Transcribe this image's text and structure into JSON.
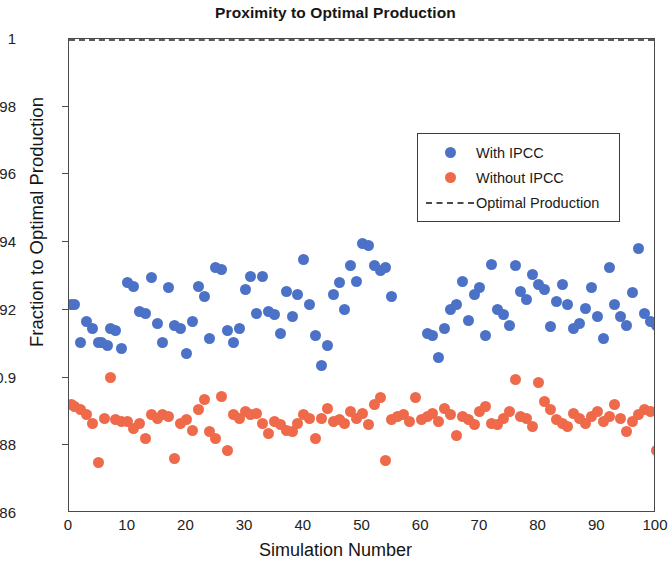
{
  "chart_data": {
    "type": "scatter",
    "title": "Proximity to Optimal Production",
    "xlabel": "Simulation Number",
    "ylabel": "Fraction to Optimal Production",
    "xlim": [
      0,
      100
    ],
    "ylim": [
      0.86,
      1
    ],
    "xticks": [
      0,
      10,
      20,
      30,
      40,
      50,
      60,
      70,
      80,
      90,
      100
    ],
    "xtick_labels": [
      "0",
      "10",
      "20",
      "30",
      "40",
      "50",
      "60",
      "70",
      "80",
      "90",
      "100"
    ],
    "yticks": [
      0.86,
      0.88,
      0.9,
      0.92,
      0.94,
      0.96,
      0.98,
      1
    ],
    "ytick_labels": [
      "0.86",
      "0.88",
      "0.9",
      "0.92",
      "0.94",
      "0.96",
      "0.98",
      "1"
    ],
    "grid": false,
    "legend_position": "upper-right-inside",
    "colors": {
      "with_ipcc": "#4c72c8",
      "without_ipcc": "#ee6a4b",
      "optimal": "#5a5a5a"
    },
    "reference_line": {
      "label": "Optimal Production",
      "y": 1.0,
      "style": "dashed"
    },
    "legend": [
      {
        "label": "With IPCC",
        "marker": "circle",
        "color": "#4c72c8"
      },
      {
        "label": "Without IPCC",
        "marker": "circle",
        "color": "#ee6a4b"
      },
      {
        "label": "Optimal Production",
        "marker": "dashed-line",
        "color": "#5a5a5a"
      }
    ],
    "series": [
      {
        "name": "With IPCC",
        "color": "#4c72c8",
        "x": [
          0.5,
          1,
          2,
          3,
          4,
          5,
          5.5,
          6.5,
          7,
          8,
          9,
          10,
          11,
          12,
          13,
          14,
          15,
          16,
          17,
          18,
          19,
          20,
          21,
          22,
          23,
          24,
          25,
          26,
          27,
          28,
          29,
          30,
          31,
          32,
          33,
          34,
          35,
          36,
          37,
          38,
          39,
          40,
          41,
          42,
          43,
          44,
          45,
          46,
          47,
          48,
          49,
          50,
          51,
          52,
          53,
          54,
          55,
          61,
          62,
          63,
          64,
          65,
          66,
          67,
          68,
          69,
          70,
          71,
          72,
          73,
          74,
          75,
          76,
          77,
          78,
          79,
          80,
          81,
          82,
          83,
          84,
          85,
          86,
          87,
          88,
          89,
          90,
          91,
          92,
          93,
          94,
          95,
          96,
          97,
          98,
          99,
          100
        ],
        "y": [
          0.9215,
          0.9215,
          0.9105,
          0.9165,
          0.9145,
          0.9105,
          0.9105,
          0.9095,
          0.9145,
          0.914,
          0.9085,
          0.928,
          0.927,
          0.9195,
          0.919,
          0.9295,
          0.916,
          0.9105,
          0.9265,
          0.9155,
          0.9145,
          0.907,
          0.9165,
          0.927,
          0.924,
          0.9115,
          0.9325,
          0.932,
          0.914,
          0.9105,
          0.9145,
          0.926,
          0.93,
          0.919,
          0.93,
          0.9195,
          0.9185,
          0.913,
          0.9255,
          0.918,
          0.9245,
          0.935,
          0.9215,
          0.9125,
          0.9035,
          0.9095,
          0.9245,
          0.928,
          0.92,
          0.933,
          0.9285,
          0.9395,
          0.939,
          0.933,
          0.9315,
          0.9325,
          0.924,
          0.913,
          0.9125,
          0.906,
          0.9145,
          0.92,
          0.9215,
          0.9285,
          0.917,
          0.9245,
          0.9265,
          0.9125,
          0.9335,
          0.92,
          0.9185,
          0.9155,
          0.933,
          0.9255,
          0.923,
          0.9305,
          0.9275,
          0.926,
          0.915,
          0.9225,
          0.9275,
          0.9215,
          0.9145,
          0.916,
          0.9205,
          0.9265,
          0.918,
          0.9115,
          0.9325,
          0.9215,
          0.918,
          0.9155,
          0.925,
          0.938,
          0.919,
          0.9165,
          0.9155
        ]
      },
      {
        "name": "Without IPCC",
        "color": "#ee6a4b",
        "x": [
          0.5,
          1,
          2,
          3,
          4,
          5,
          6,
          7,
          8,
          9,
          10,
          11,
          12,
          13,
          14,
          15,
          16,
          17,
          18,
          19,
          20,
          21,
          22,
          23,
          24,
          25,
          26,
          27,
          28,
          29,
          30,
          31,
          32,
          33,
          34,
          35,
          36,
          37,
          38,
          39,
          40,
          41,
          42,
          43,
          44,
          45,
          46,
          47,
          48,
          49,
          50,
          51,
          52,
          53,
          54,
          55,
          56,
          57,
          58,
          59,
          60,
          61,
          62,
          63,
          64,
          65,
          66,
          67,
          68,
          69,
          70,
          71,
          72,
          73,
          74,
          75,
          76,
          77,
          78,
          79,
          80,
          81,
          82,
          83,
          84,
          85,
          86,
          87,
          88,
          89,
          90,
          91,
          92,
          93,
          94,
          95,
          96,
          97,
          98,
          99,
          100
        ],
        "y": [
          0.892,
          0.8915,
          0.8905,
          0.889,
          0.8865,
          0.875,
          0.888,
          0.9,
          0.8875,
          0.887,
          0.887,
          0.885,
          0.8865,
          0.882,
          0.889,
          0.888,
          0.889,
          0.8885,
          0.876,
          0.8865,
          0.8875,
          0.8845,
          0.8905,
          0.8935,
          0.884,
          0.882,
          0.8945,
          0.8785,
          0.889,
          0.888,
          0.89,
          0.889,
          0.8895,
          0.8865,
          0.8835,
          0.887,
          0.886,
          0.8845,
          0.884,
          0.8865,
          0.889,
          0.888,
          0.882,
          0.888,
          0.891,
          0.887,
          0.8875,
          0.8865,
          0.89,
          0.888,
          0.8895,
          0.886,
          0.892,
          0.894,
          0.8755,
          0.8875,
          0.8885,
          0.889,
          0.887,
          0.894,
          0.8875,
          0.8885,
          0.8895,
          0.887,
          0.891,
          0.889,
          0.883,
          0.8885,
          0.8875,
          0.886,
          0.89,
          0.8915,
          0.8865,
          0.886,
          0.888,
          0.89,
          0.8995,
          0.8885,
          0.888,
          0.8855,
          0.8985,
          0.893,
          0.8905,
          0.8875,
          0.8865,
          0.8855,
          0.8895,
          0.888,
          0.8865,
          0.8885,
          0.89,
          0.887,
          0.8885,
          0.892,
          0.888,
          0.884,
          0.887,
          0.889,
          0.8905,
          0.89,
          0.8785
        ]
      }
    ]
  }
}
